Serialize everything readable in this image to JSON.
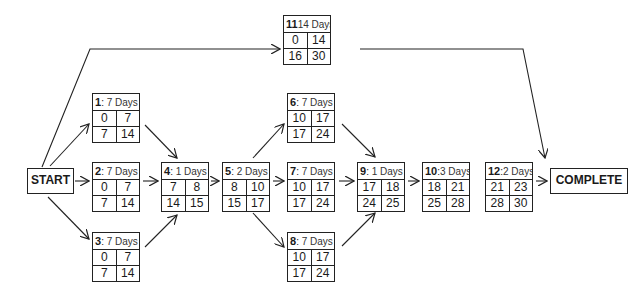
{
  "diagram": {
    "type": "activity-on-node network (critical path)",
    "start": {
      "label": "START"
    },
    "end": {
      "label": "COMPLETE"
    },
    "duration_unit": "Days",
    "nodes": [
      {
        "id": "1",
        "sep": ": ",
        "duration": "7 Days",
        "es": "0",
        "ef": "7",
        "ls": "7",
        "lf": "14"
      },
      {
        "id": "2",
        "sep": ": ",
        "duration": "7 Days",
        "es": "0",
        "ef": "7",
        "ls": "7",
        "lf": "14"
      },
      {
        "id": "3",
        "sep": ": ",
        "duration": "7 Days",
        "es": "0",
        "ef": "7",
        "ls": "7",
        "lf": "14"
      },
      {
        "id": "4",
        "sep": ": ",
        "duration": "1 Days",
        "es": "7",
        "ef": "8",
        "ls": "14",
        "lf": "15"
      },
      {
        "id": "5",
        "sep": ": ",
        "duration": "2 Days",
        "es": "8",
        "ef": "10",
        "ls": "15",
        "lf": "17"
      },
      {
        "id": "6",
        "sep": ": ",
        "duration": "7 Days",
        "es": "10",
        "ef": "17",
        "ls": "17",
        "lf": "24"
      },
      {
        "id": "7",
        "sep": ": ",
        "duration": "7 Days",
        "es": "10",
        "ef": "17",
        "ls": "17",
        "lf": "24"
      },
      {
        "id": "8",
        "sep": ": ",
        "duration": "7 Days",
        "es": "10",
        "ef": "17",
        "ls": "17",
        "lf": "24"
      },
      {
        "id": "9",
        "sep": ": ",
        "duration": "1 Days",
        "es": "17",
        "ef": "18",
        "ls": "24",
        "lf": "25"
      },
      {
        "id": "10",
        "sep": ":",
        "duration": "3 Days",
        "es": "18",
        "ef": "21",
        "ls": "25",
        "lf": "28"
      },
      {
        "id": "11",
        "sep": "",
        "duration": "14 Days",
        "es": "0",
        "ef": "14",
        "ls": "16",
        "lf": "30"
      },
      {
        "id": "12",
        "sep": ":",
        "duration": "2 Days",
        "es": "21",
        "ef": "23",
        "ls": "28",
        "lf": "30"
      }
    ],
    "edges": [
      [
        "START",
        "1"
      ],
      [
        "START",
        "2"
      ],
      [
        "START",
        "3"
      ],
      [
        "START",
        "11"
      ],
      [
        "1",
        "4"
      ],
      [
        "2",
        "4"
      ],
      [
        "3",
        "4"
      ],
      [
        "4",
        "5"
      ],
      [
        "5",
        "6"
      ],
      [
        "5",
        "7"
      ],
      [
        "5",
        "8"
      ],
      [
        "6",
        "9"
      ],
      [
        "7",
        "9"
      ],
      [
        "8",
        "9"
      ],
      [
        "9",
        "10"
      ],
      [
        "11",
        "COMPLETE"
      ],
      [
        "12",
        "COMPLETE"
      ]
    ],
    "colors": {
      "line": "#222222",
      "background": "#ffffff"
    }
  }
}
